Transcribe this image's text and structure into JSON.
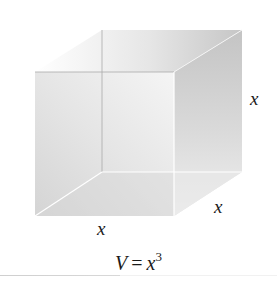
{
  "diagram": {
    "shape": "cube",
    "edge_labels": {
      "height": "x",
      "depth": "x",
      "width": "x"
    },
    "formula": {
      "lhs": "V",
      "operator": "=",
      "base": "x",
      "exponent": "3"
    },
    "colors": {
      "face_light": "#f7f7f7",
      "face_mid": "#dcdcdc",
      "face_dark": "#c4c4c4",
      "hidden_edge": "#a8a8a8",
      "highlight_edge": "#ffffff",
      "text": "#1a1a1a"
    }
  }
}
